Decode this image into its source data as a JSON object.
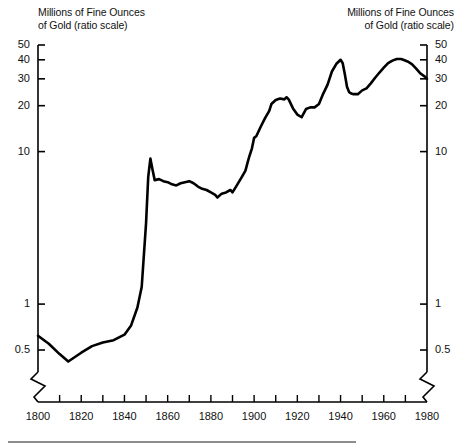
{
  "figure": {
    "caption_left": "Millions of Fine Ounces\nof Gold (ratio scale)",
    "caption_right": "Millions of Fine Ounces\nof Gold (ratio scale)",
    "line_color": "#000000",
    "axis_color": "#000000",
    "rule_color": "#8d8d8d",
    "background": "#ffffff"
  },
  "chart_data": {
    "type": "line",
    "title": "Millions of Fine Ounces of Gold (ratio scale)",
    "xlabel": "",
    "ylabel": "Millions of Fine Ounces of Gold (ratio scale)",
    "yscale": "log",
    "ylim": [
      0.4,
      55
    ],
    "xlim": [
      1800,
      1980
    ],
    "grid": false,
    "legend": false,
    "axis_break_left": true,
    "axis_break_right": true,
    "y_ticks": [
      0.5,
      1,
      10,
      20,
      30,
      40,
      50
    ],
    "y_tick_labels": [
      "0.5",
      "1",
      "10",
      "20",
      "30",
      "40",
      "50"
    ],
    "y_ticks_right": [
      0.5,
      1,
      10,
      20,
      30,
      40,
      50
    ],
    "y_tick_labels_right": [
      "0.5",
      "1",
      "10",
      "20",
      "30",
      "40",
      "50"
    ],
    "x_ticks_major": [
      1800,
      1820,
      1840,
      1860,
      1880,
      1900,
      1920,
      1940,
      1960,
      1980
    ],
    "x_tick_labels": [
      "1800",
      "1820",
      "1840",
      "1860",
      "1880",
      "1900",
      "1920",
      "1940",
      "1960",
      "1980"
    ],
    "x_ticks_minor": [
      1810,
      1830,
      1850,
      1870,
      1890,
      1910,
      1930,
      1950,
      1970
    ],
    "series": [
      {
        "name": "World gold production",
        "color": "#000000",
        "x": [
          1800,
          1805,
          1810,
          1814,
          1820,
          1825,
          1830,
          1835,
          1840,
          1843,
          1846,
          1848,
          1850,
          1851,
          1852,
          1853,
          1854,
          1856,
          1858,
          1860,
          1862,
          1864,
          1866,
          1868,
          1870,
          1872,
          1874,
          1876,
          1878,
          1880,
          1882,
          1883,
          1885,
          1887,
          1889,
          1890,
          1892,
          1894,
          1896,
          1897,
          1898,
          1899,
          1900,
          1901,
          1903,
          1905,
          1907,
          1908,
          1910,
          1912,
          1914,
          1915,
          1916,
          1918,
          1920,
          1922,
          1924,
          1926,
          1928,
          1930,
          1932,
          1934,
          1936,
          1938,
          1940,
          1941,
          1942,
          1943,
          1944,
          1945,
          1946,
          1948,
          1950,
          1952,
          1954,
          1956,
          1958,
          1960,
          1962,
          1964,
          1966,
          1968,
          1969,
          1971,
          1973,
          1975,
          1977,
          1979,
          1980
        ],
        "y": [
          0.62,
          0.55,
          0.47,
          0.42,
          0.48,
          0.53,
          0.56,
          0.58,
          0.63,
          0.72,
          0.95,
          1.3,
          3.4,
          6.8,
          9.0,
          7.6,
          6.5,
          6.6,
          6.4,
          6.3,
          6.1,
          6.0,
          6.2,
          6.3,
          6.4,
          6.2,
          5.9,
          5.7,
          5.6,
          5.4,
          5.2,
          5.0,
          5.3,
          5.4,
          5.6,
          5.4,
          6.0,
          6.7,
          7.5,
          8.5,
          9.5,
          10.5,
          12.3,
          12.6,
          14.5,
          16.5,
          18.5,
          20.5,
          21.8,
          22.3,
          22.0,
          22.7,
          22.0,
          19.2,
          17.5,
          16.8,
          19.0,
          19.5,
          19.5,
          20.5,
          24.0,
          27.5,
          33.5,
          37.5,
          40.0,
          38.0,
          32.0,
          26.5,
          24.5,
          24.0,
          23.8,
          23.8,
          25.2,
          26.0,
          28.0,
          30.5,
          33.0,
          35.5,
          38.0,
          39.5,
          40.5,
          40.5,
          40.0,
          39.0,
          37.5,
          35.0,
          32.5,
          31.0,
          30.0
        ]
      }
    ]
  }
}
